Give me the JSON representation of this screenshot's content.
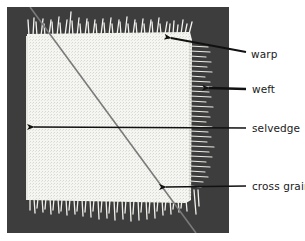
{
  "figure": {
    "colors": {
      "page_background": "#ffffff",
      "photo_background": "#3d3d3d",
      "fabric": "#f4f4f0",
      "diagonal_line": "#7a7a7a",
      "arrow": "#111111",
      "label_text": "#1a1a1a"
    },
    "labels": [
      {
        "id": "warp",
        "text": "warp",
        "x": 251,
        "y": 48,
        "arrow_tip": [
          168,
          38
        ],
        "arrow_tail": [
          246,
          52
        ]
      },
      {
        "id": "weft",
        "text": "weft",
        "x": 252,
        "y": 83,
        "arrow_tip": [
          206,
          88
        ],
        "arrow_tail": [
          246,
          89
        ]
      },
      {
        "id": "selvedge",
        "text": "selvedge",
        "x": 252,
        "y": 122,
        "arrow_tip": [
          31,
          127
        ],
        "arrow_tail": [
          246,
          128
        ]
      },
      {
        "id": "cross-grain",
        "text": "cross grain",
        "x": 252,
        "y": 180,
        "arrow_tip": [
          163,
          187
        ],
        "arrow_tail": [
          246,
          186
        ]
      }
    ],
    "diagonal": {
      "from": [
        30,
        7
      ],
      "to": [
        196,
        233
      ]
    }
  }
}
